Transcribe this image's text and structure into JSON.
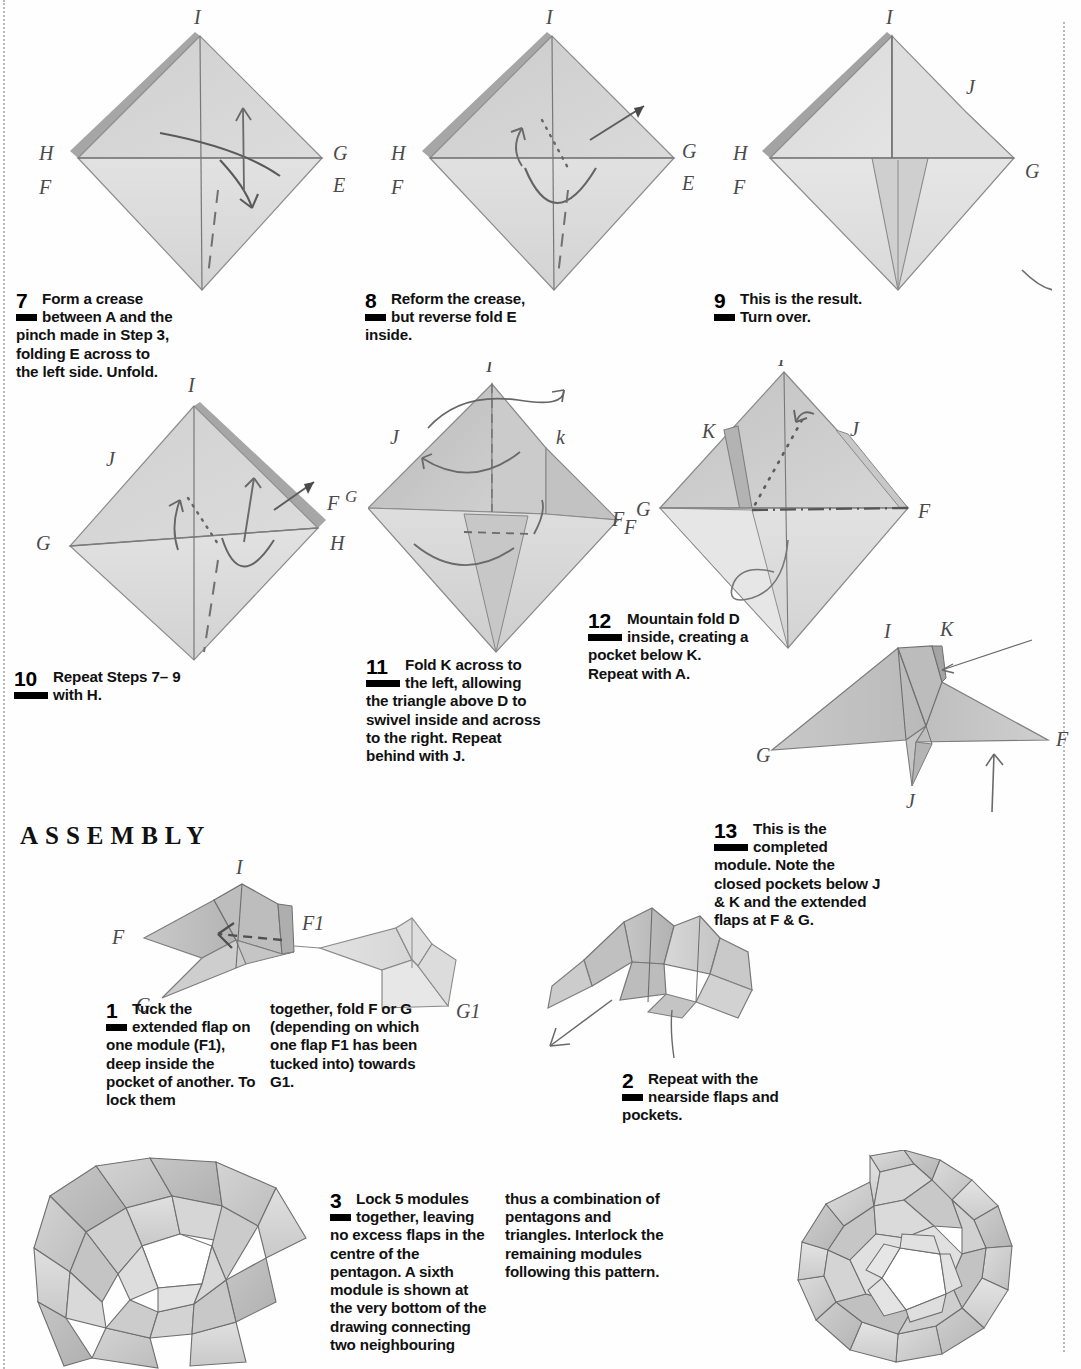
{
  "page": {
    "width": 1081,
    "height": 1369,
    "background": "#fefefe",
    "section_heading": "ASSEMBLY"
  },
  "palette": {
    "paper_light": "#e4e4e4",
    "paper_mid": "#d2d2d2",
    "paper_dark": "#bcbcbc",
    "paper_darker": "#a9a9a9",
    "ink": "#4a4a4a",
    "text": "#111111",
    "rule": "#b9b9b9"
  },
  "steps": [
    {
      "id": "step-7",
      "number": "7",
      "text": "Form a crease between A and the pinch made in Step 3, folding E across to the left side. Unfold.",
      "column2": ""
    },
    {
      "id": "step-8",
      "number": "8",
      "text": "Reform the crease, but reverse fold E inside.",
      "column2": ""
    },
    {
      "id": "step-9",
      "number": "9",
      "text": "This is the result. Turn over.",
      "column2": ""
    },
    {
      "id": "step-10",
      "number": "10",
      "text": "Repeat Steps 7– 9 with H.",
      "column2": ""
    },
    {
      "id": "step-11",
      "number": "11",
      "text": "Fold K across to the left, allowing the triangle above D to swivel inside and across to the right. Repeat behind with J.",
      "column2": ""
    },
    {
      "id": "step-12",
      "number": "12",
      "text": "Mountain fold D inside, creating a pocket below K. Repeat with A.",
      "column2": ""
    },
    {
      "id": "step-13",
      "number": "13",
      "text": "This is the completed module. Note the closed pockets below J & K and the extended flaps at F & G.",
      "column2": ""
    }
  ],
  "assembly_steps": [
    {
      "id": "assembly-1",
      "number": "1",
      "text": "Tuck the extended flap on one module (F1), deep inside the pocket of another. To lock them",
      "column2": "together, fold F or G (depending on which one flap F1 has been tucked into) towards G1."
    },
    {
      "id": "assembly-2",
      "number": "2",
      "text": "Repeat with the nearside flaps and pockets.",
      "column2": ""
    },
    {
      "id": "assembly-3",
      "number": "3",
      "text": "Lock 5 modules together, leaving no excess flaps in the centre of the pentagon. A sixth module is shown at the very bottom of the drawing connecting two neighbouring",
      "column2": "thus a combination of pentagons and triangles. Interlock the remaining modules following this pattern."
    }
  ],
  "diagrams": [
    {
      "id": "diagram-7",
      "caption_step": "7",
      "shape": "kite-diamond",
      "labels": [
        {
          "text": "I",
          "pos": "top"
        },
        {
          "text": "H",
          "pos": "upper-left"
        },
        {
          "text": "F",
          "pos": "left"
        },
        {
          "text": "G",
          "pos": "upper-right"
        },
        {
          "text": "E",
          "pos": "right"
        },
        {
          "text": "D",
          "pos": "bottom-left"
        },
        {
          "text": "A",
          "pos": "bottom-right"
        }
      ],
      "annotations": [
        "fold-arrow-curved",
        "valley-dashed-line",
        "arrow-up"
      ]
    },
    {
      "id": "diagram-8",
      "caption_step": "8",
      "shape": "kite-diamond",
      "labels": [
        {
          "text": "I",
          "pos": "top"
        },
        {
          "text": "H",
          "pos": "upper-left"
        },
        {
          "text": "F",
          "pos": "left"
        },
        {
          "text": "G",
          "pos": "upper-right"
        },
        {
          "text": "E",
          "pos": "right"
        },
        {
          "text": "D",
          "pos": "bottom-left"
        },
        {
          "text": "A",
          "pos": "bottom-right"
        }
      ],
      "annotations": [
        "reverse-fold-arrow",
        "dotted-crease",
        "push-arrow",
        "rotation-arc"
      ]
    },
    {
      "id": "diagram-9",
      "caption_step": "9",
      "shape": "kite-diamond-folded",
      "labels": [
        {
          "text": "I",
          "pos": "top"
        },
        {
          "text": "J",
          "pos": "upper-right"
        },
        {
          "text": "H",
          "pos": "upper-left"
        },
        {
          "text": "F",
          "pos": "left"
        },
        {
          "text": "G",
          "pos": "right"
        },
        {
          "text": "D",
          "pos": "bottom-left"
        },
        {
          "text": "A",
          "pos": "bottom-right"
        }
      ],
      "annotations": [
        "turn-over-arrow"
      ]
    },
    {
      "id": "diagram-10",
      "caption_step": "10",
      "shape": "kite-diamond-mirrored",
      "labels": [
        {
          "text": "I",
          "pos": "top"
        },
        {
          "text": "J",
          "pos": "upper-left"
        },
        {
          "text": "G",
          "pos": "left"
        },
        {
          "text": "F",
          "pos": "upper-right"
        },
        {
          "text": "G",
          "pos": "far-right"
        },
        {
          "text": "H",
          "pos": "right"
        },
        {
          "text": "A",
          "pos": "bottom-left"
        },
        {
          "text": "D",
          "pos": "bottom-right"
        }
      ],
      "annotations": [
        "fold-arrow-curved",
        "valley-dashed-line",
        "push-arrow",
        "rotation-arc"
      ]
    },
    {
      "id": "diagram-11",
      "caption_step": "11",
      "shape": "kite-diamond-3d",
      "labels": [
        {
          "text": "I",
          "pos": "top"
        },
        {
          "text": "J",
          "pos": "upper-left"
        },
        {
          "text": "k",
          "pos": "upper-right"
        },
        {
          "text": "F",
          "pos": "right"
        },
        {
          "text": "G",
          "pos": "far-right"
        },
        {
          "text": "A",
          "pos": "bottom-left"
        },
        {
          "text": "D",
          "pos": "bottom-right"
        }
      ],
      "annotations": [
        "swivel-loop",
        "rotation-arrow",
        "dashed-hidden-edge"
      ]
    },
    {
      "id": "diagram-12",
      "caption_step": "12",
      "shape": "kite-diamond-swivelled",
      "labels": [
        {
          "text": "I",
          "pos": "top"
        },
        {
          "text": "K",
          "pos": "upper-left"
        },
        {
          "text": "J",
          "pos": "upper-right"
        },
        {
          "text": "G",
          "pos": "left"
        },
        {
          "text": "F",
          "pos": "far-left"
        },
        {
          "text": "F",
          "pos": "right"
        },
        {
          "text": "A",
          "pos": "bottom-left"
        },
        {
          "text": "D",
          "pos": "bottom-right"
        }
      ],
      "annotations": [
        "dotted-mountain-line",
        "dash-dot-line",
        "mountain-fold-loop"
      ]
    },
    {
      "id": "diagram-13",
      "caption_step": "13",
      "shape": "completed-module",
      "labels": [
        {
          "text": "I",
          "pos": "top-left-peak"
        },
        {
          "text": "K",
          "pos": "top-right-peak"
        },
        {
          "text": "G",
          "pos": "left-point"
        },
        {
          "text": "F",
          "pos": "right-point"
        },
        {
          "text": "J",
          "pos": "bottom-point"
        }
      ],
      "annotations": [
        "pointer-line-to-pocket",
        "up-arrow"
      ]
    },
    {
      "id": "diagram-assembly-1",
      "caption_step": "1",
      "shape": "two-modules-joining",
      "labels": [
        {
          "text": "I",
          "pos": "top"
        },
        {
          "text": "F",
          "pos": "left-point"
        },
        {
          "text": "G",
          "pos": "bottom-left-point"
        },
        {
          "text": "F1",
          "pos": "right-of-first"
        },
        {
          "text": "G1",
          "pos": "bottom-right"
        }
      ],
      "annotations": [
        "dashed-tuck-arrow",
        "connector-line"
      ]
    },
    {
      "id": "diagram-assembly-2",
      "caption_step": "2",
      "shape": "two-modules-locked",
      "labels": [],
      "annotations": [
        "pointer-arrow-left",
        "pointer-line-down"
      ]
    },
    {
      "id": "diagram-assembly-3-left",
      "caption_step": "3",
      "shape": "five-module-pentagon-cluster",
      "labels": [],
      "annotations": []
    },
    {
      "id": "diagram-assembly-3-right",
      "caption_step": "3",
      "shape": "completed-dodecahedral-star",
      "labels": [],
      "annotations": []
    }
  ]
}
